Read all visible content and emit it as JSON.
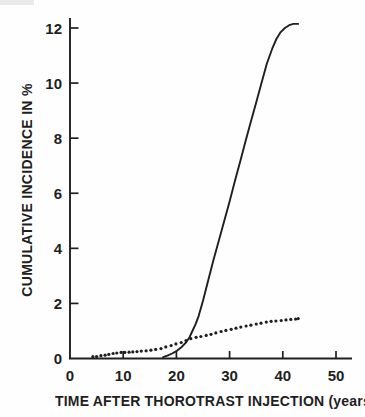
{
  "figure": {
    "background": "#fefefe",
    "ink_color": "#1f1f1f",
    "scan_artifact_color": "#eaeaea"
  },
  "chart_data": {
    "type": "line",
    "title": "",
    "xlabel": "TIME AFTER THOROTRAST INJECTION (years)",
    "ylabel": "CUMULATIVE INCIDENCE IN %",
    "xlim": [
      0,
      53
    ],
    "ylim": [
      0,
      12.3
    ],
    "x_ticks": [
      0,
      10,
      20,
      30,
      40,
      50
    ],
    "y_ticks": [
      0,
      2,
      4,
      6,
      8,
      10,
      12
    ],
    "grid": false,
    "legend": "none",
    "series": [
      {
        "name": "solid-curve",
        "style": "solid",
        "color": "#1f1f1f",
        "points": [
          [
            17.5,
            0.05
          ],
          [
            18.3,
            0.1
          ],
          [
            19.2,
            0.18
          ],
          [
            20.1,
            0.28
          ],
          [
            21.0,
            0.42
          ],
          [
            21.8,
            0.58
          ],
          [
            22.4,
            0.75
          ],
          [
            23.0,
            1.0
          ],
          [
            23.6,
            1.25
          ],
          [
            24.2,
            1.55
          ],
          [
            25.0,
            2.1
          ],
          [
            26.0,
            2.85
          ],
          [
            27.0,
            3.6
          ],
          [
            28.0,
            4.3
          ],
          [
            29.0,
            5.0
          ],
          [
            30.0,
            5.7
          ],
          [
            31.0,
            6.45
          ],
          [
            32.0,
            7.15
          ],
          [
            33.0,
            7.9
          ],
          [
            34.0,
            8.6
          ],
          [
            35.0,
            9.3
          ],
          [
            36.0,
            10.0
          ],
          [
            37.0,
            10.7
          ],
          [
            38.0,
            11.25
          ],
          [
            38.8,
            11.6
          ],
          [
            39.6,
            11.85
          ],
          [
            40.4,
            12.0
          ],
          [
            41.2,
            12.1
          ],
          [
            42.0,
            12.15
          ],
          [
            42.9,
            12.15
          ]
        ]
      },
      {
        "name": "dotted-curve",
        "style": "dotted",
        "color": "#1f1f1f",
        "points": [
          [
            4.3,
            0.07
          ],
          [
            5.0,
            0.07
          ],
          [
            5.8,
            0.1
          ],
          [
            6.6,
            0.12
          ],
          [
            7.3,
            0.15
          ],
          [
            8.1,
            0.18
          ],
          [
            8.8,
            0.2
          ],
          [
            9.6,
            0.22
          ],
          [
            10.3,
            0.22
          ],
          [
            11.1,
            0.23
          ],
          [
            11.8,
            0.24
          ],
          [
            12.6,
            0.25
          ],
          [
            13.4,
            0.27
          ],
          [
            14.3,
            0.28
          ],
          [
            15.2,
            0.3
          ],
          [
            16.1,
            0.33
          ],
          [
            17.1,
            0.36
          ],
          [
            18.0,
            0.42
          ],
          [
            19.0,
            0.47
          ],
          [
            19.9,
            0.53
          ],
          [
            20.9,
            0.58
          ],
          [
            21.8,
            0.65
          ],
          [
            22.7,
            0.72
          ],
          [
            23.7,
            0.77
          ],
          [
            24.6,
            0.8
          ],
          [
            25.6,
            0.84
          ],
          [
            26.5,
            0.88
          ],
          [
            27.4,
            0.93
          ],
          [
            28.4,
            0.98
          ],
          [
            29.3,
            1.02
          ],
          [
            30.3,
            1.06
          ],
          [
            31.2,
            1.1
          ],
          [
            32.1,
            1.14
          ],
          [
            33.1,
            1.18
          ],
          [
            34.0,
            1.21
          ],
          [
            35.0,
            1.25
          ],
          [
            35.9,
            1.28
          ],
          [
            36.9,
            1.32
          ],
          [
            37.8,
            1.35
          ],
          [
            38.7,
            1.36
          ],
          [
            39.7,
            1.38
          ],
          [
            40.6,
            1.4
          ],
          [
            41.5,
            1.42
          ],
          [
            42.4,
            1.43
          ],
          [
            42.9,
            1.45
          ]
        ]
      }
    ]
  }
}
